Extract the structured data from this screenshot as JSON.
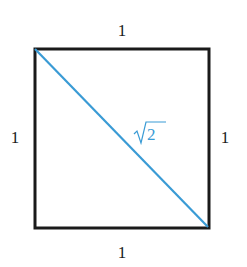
{
  "diagram": {
    "labels": {
      "top": "1",
      "bottom": "1",
      "left": "1",
      "right": "1",
      "diagonal_radicand": "2",
      "diagonal_symbol": "√"
    },
    "colors": {
      "square_stroke": "#1a1a1a",
      "diagonal": "#3a9bd5",
      "diagonal_label": "#3a9bd5"
    }
  }
}
